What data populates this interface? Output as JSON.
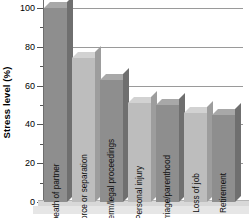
{
  "chart_data": {
    "type": "bar",
    "title": "",
    "xlabel": "",
    "ylabel": "Stress level (%)",
    "ylim": [
      0,
      100
    ],
    "yticks": [
      0,
      20,
      40,
      60,
      80,
      100
    ],
    "ytick_labels": [
      "0",
      "20",
      "40",
      "60",
      "80",
      "100"
    ],
    "minor_tick_interval": 10,
    "grid": true,
    "grid_axis": "y",
    "legend": false,
    "categories": [
      "Death of partner",
      "Divorce or separation",
      "Prison term/legal proceedings",
      "Personal injury",
      "Marriage/parenthood",
      "Loss of job",
      "Retirement"
    ],
    "values": [
      100,
      74,
      63,
      51,
      50,
      46,
      45
    ],
    "series": [
      {
        "name": "Stress level",
        "values": [
          100,
          74,
          63,
          51,
          50,
          46,
          45
        ]
      }
    ]
  },
  "style": {
    "bar_color_dark": "#8e8e8e",
    "bar_color_light": "#bdbdbd",
    "bar_top_dark": "#a8a8a8",
    "bar_top_light": "#d2d2d2",
    "bar_side_dark": "#6f6f6f",
    "bar_side_light": "#9d9d9d",
    "gridline_color": "#9a9a9a",
    "axis_color": "#6e6e6e",
    "base_color": "#d8d8d8",
    "background": "#ffffff",
    "text_color": "#000000"
  }
}
